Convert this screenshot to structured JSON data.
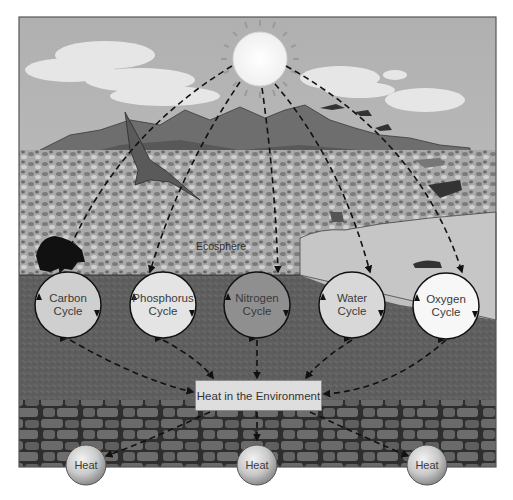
{
  "diagram": {
    "sun": {
      "label": ""
    },
    "ecosphere_label": "Ecosphere",
    "cycles": [
      {
        "line1": "Carbon",
        "line2": "Cycle",
        "fill": "#cfcfcf"
      },
      {
        "line1": "Phosphorus",
        "line2": "Cycle",
        "fill": "#e4e4e4"
      },
      {
        "line1": "Nitrogen",
        "line2": "Cycle",
        "fill": "#8f8f8f"
      },
      {
        "line1": "Water",
        "line2": "Cycle",
        "fill": "#d8d8d8"
      },
      {
        "line1": "Oxygen",
        "line2": "Cycle",
        "fill": "#f7f7f7"
      }
    ],
    "heat_environment_label": "Heat in the Environment",
    "heat_outputs": [
      "Heat",
      "Heat",
      "Heat"
    ]
  },
  "colors": {
    "sky": "#b8b8b8",
    "mountains": "#6e6e6e",
    "vegetation": "#9a9a9a",
    "water": "#c4c4c4",
    "soil": "#5c5c5c",
    "rock": "#4a4a4a",
    "frame": "#555555"
  }
}
